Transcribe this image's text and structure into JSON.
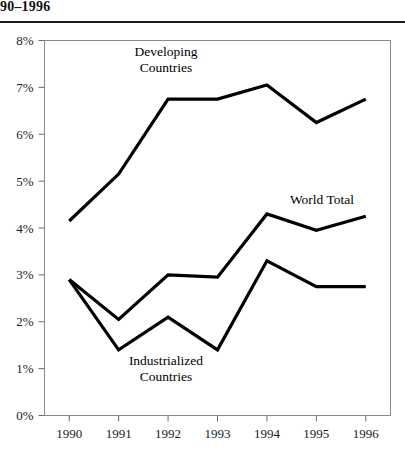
{
  "title": "90–1996",
  "chart_data": {
    "type": "line",
    "title": "90–1996",
    "xlabel": "",
    "ylabel": "",
    "x": [
      "1990",
      "1991",
      "1992",
      "1993",
      "1994",
      "1995",
      "1996"
    ],
    "categories": [
      "1990",
      "1991",
      "1992",
      "1993",
      "1994",
      "1995",
      "1996"
    ],
    "xtick_labels": [
      "1990",
      "1991",
      "1992",
      "1993",
      "1994",
      "1995",
      "1996"
    ],
    "ytick_labels": [
      "0%",
      "1%",
      "2%",
      "3%",
      "4%",
      "5%",
      "6%",
      "7%",
      "8%"
    ],
    "ytick_values": [
      0,
      1,
      2,
      3,
      4,
      5,
      6,
      7,
      8
    ],
    "ylim": [
      0,
      8
    ],
    "yunit": "%",
    "grid": false,
    "legend": "inline-annotations",
    "series": [
      {
        "name": "Developing Countries",
        "values": [
          4.15,
          5.15,
          6.75,
          6.75,
          7.05,
          6.25,
          6.75
        ],
        "color": "#000000",
        "label_x": "1992",
        "label_y": 7.8
      },
      {
        "name": "World Total",
        "values": [
          2.9,
          2.05,
          3.0,
          2.95,
          4.3,
          3.95,
          4.25
        ],
        "color": "#000000",
        "label_x": "1995",
        "label_y": 4.95
      },
      {
        "name": "Industrialized Countries",
        "values": [
          2.9,
          1.4,
          2.1,
          1.4,
          3.3,
          2.75,
          2.75
        ],
        "color": "#000000",
        "label_x": "1992",
        "label_y": 1.05
      }
    ],
    "annotations": [
      {
        "text_line1": "Developing",
        "text_line2": "Countries"
      },
      {
        "text_line1": "World Total",
        "text_line2": ""
      },
      {
        "text_line1": "Industrialized",
        "text_line2": "Countries"
      }
    ]
  }
}
